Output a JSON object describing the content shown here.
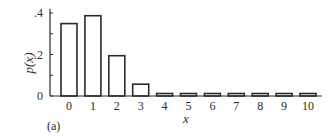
{
  "chart_data": {
    "type": "bar",
    "title": "",
    "panel_label": "(a)",
    "xlabel": "x",
    "ylabel": "p(x)",
    "categories": [
      "0",
      "1",
      "2",
      "3",
      "4",
      "5",
      "6",
      "7",
      "8",
      "9",
      "10"
    ],
    "values": [
      0.349,
      0.387,
      0.194,
      0.057,
      0.011,
      0.001,
      0.0,
      0.0,
      0.0,
      0.0,
      0.0
    ],
    "ylim": [
      0,
      0.4
    ],
    "yticks": [
      {
        "value": 0,
        "label": "0"
      },
      {
        "value": 0.1,
        "label": ""
      },
      {
        "value": 0.2,
        "label": ".2"
      },
      {
        "value": 0.3,
        "label": ""
      },
      {
        "value": 0.4,
        "label": ".4"
      }
    ],
    "grid": false,
    "legend": null,
    "bar_fill": "#ffffff",
    "bar_stroke": "#2a2a2a"
  }
}
